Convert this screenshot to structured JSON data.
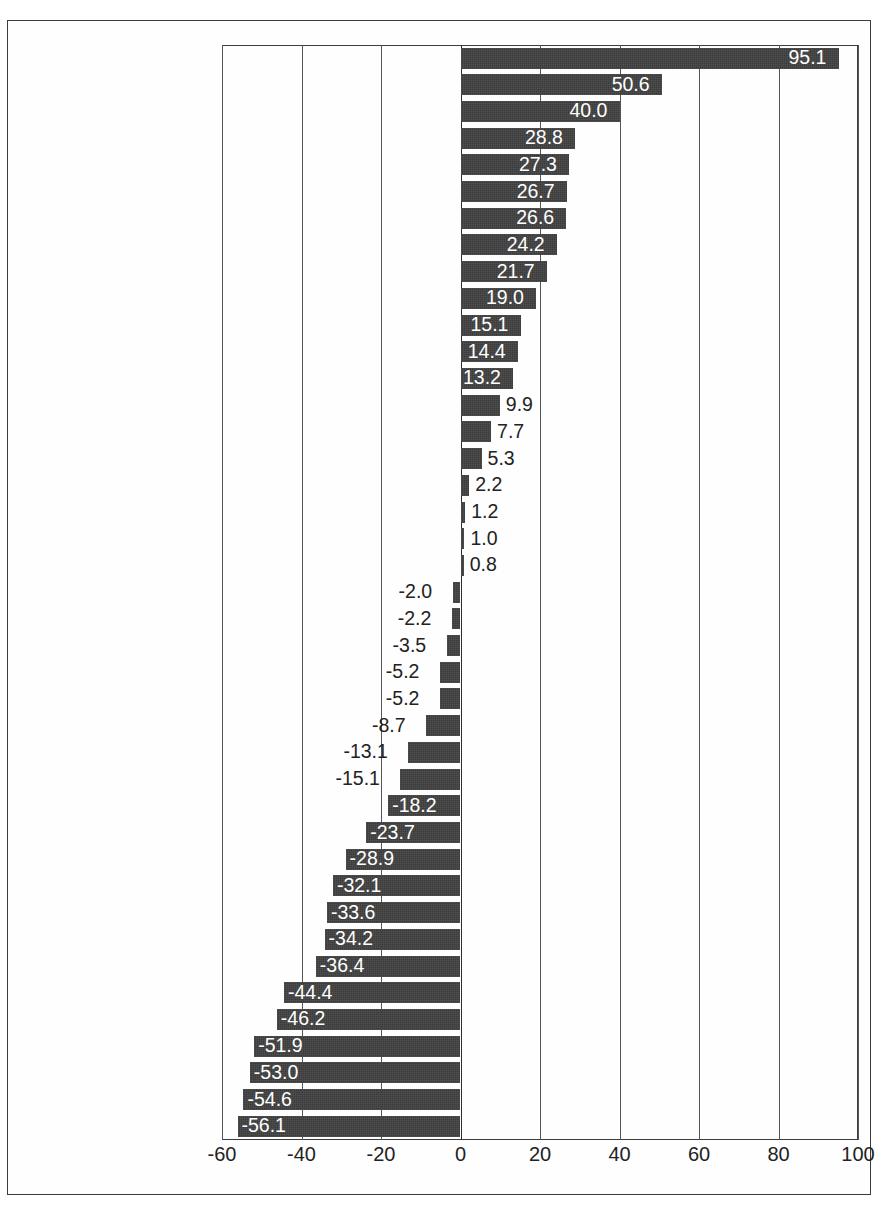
{
  "chart_data": {
    "type": "bar",
    "orientation": "horizontal",
    "title": "",
    "subtitle": "",
    "xlabel": "",
    "ylabel": "",
    "xlim": [
      -60,
      100
    ],
    "xticks": [
      -60,
      -40,
      -20,
      0,
      20,
      40,
      60,
      80,
      100
    ],
    "xtick_labels": [
      "-60",
      "-40",
      "-20",
      "0",
      "20",
      "40",
      "60",
      "80",
      "100"
    ],
    "grid": true,
    "legend": null,
    "bar_color": "#3b3b3b",
    "label_inside_color": "#ffffff",
    "label_outside_color": "#222222",
    "categories": [
      "Turkey",
      "Spain",
      "Portugal",
      "Australia",
      "Greece",
      "New Zealand",
      "Ireland",
      "Iceland",
      "Canada",
      "Liechtenstein",
      "Austria",
      "United States",
      "Finland",
      "Italy",
      "Norway",
      "Japan",
      "Denmark",
      "Slovenia",
      "Luxembourg",
      "Switzerland",
      "Netherlands",
      "European Community",
      "France",
      "Croatia",
      "Belgium",
      "Sweden",
      "Monaco",
      "United Kingdom",
      "Germany",
      "Czech Republic",
      "Poland",
      "Hungary",
      "Slovakia",
      "Russian Federation",
      "Belarus",
      "Romania",
      "Bulgaria",
      "Ukraine",
      "Lithuania",
      "Estonia",
      "Latvia"
    ],
    "values": [
      95.1,
      50.6,
      40.0,
      28.8,
      27.3,
      26.7,
      26.6,
      24.2,
      21.7,
      19.0,
      15.1,
      14.4,
      13.2,
      9.9,
      7.7,
      5.3,
      2.2,
      1.2,
      1.0,
      0.8,
      -2.0,
      -2.2,
      -3.5,
      -5.2,
      -5.2,
      -8.7,
      -13.1,
      -15.1,
      -18.2,
      -23.7,
      -28.9,
      -32.1,
      -33.6,
      -34.2,
      -36.4,
      -44.4,
      -46.2,
      -51.9,
      -53.0,
      -54.6,
      -56.1
    ],
    "value_labels": [
      "95.1",
      "50.6",
      "40.0",
      "28.8",
      "27.3",
      "26.7",
      "26.6",
      "24.2",
      "21.7",
      "19.0",
      "15.1",
      "14.4",
      "13.2",
      "9.9",
      "7.7",
      "5.3",
      "2.2",
      "1.2",
      "1.0",
      "0.8",
      "-2.0",
      "-2.2",
      "-3.5",
      "-5.2",
      "-5.2",
      "-8.7",
      "-13.1",
      "-15.1",
      "-18.2",
      "-23.7",
      "-28.9",
      "-32.1",
      "-33.6",
      "-34.2",
      "-36.4",
      "-44.4",
      "-46.2",
      "-51.9",
      "-53.0",
      "-54.6",
      "-56.1"
    ]
  }
}
